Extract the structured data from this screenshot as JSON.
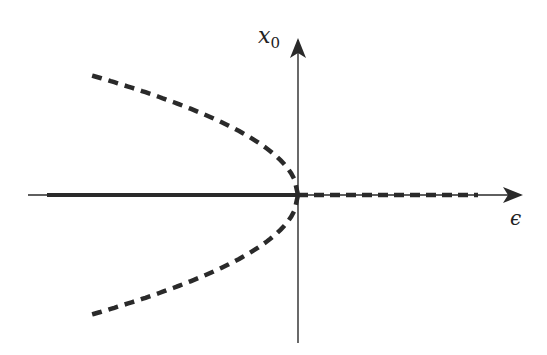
{
  "diagram": {
    "type": "bifurcation-diagram",
    "axes": {
      "x_label": "ϵ",
      "y_label": "x",
      "y_label_sub": "0"
    },
    "branches": [
      {
        "name": "trivial-stable",
        "equation": "x0 = 0, ϵ < 0",
        "style": "solid"
      },
      {
        "name": "trivial-unstable",
        "equation": "x0 = 0, ϵ > 0",
        "style": "dashed"
      },
      {
        "name": "upper-unstable",
        "equation": "x0 = +sqrt(-ϵ), ϵ < 0",
        "style": "dashed"
      },
      {
        "name": "lower-unstable",
        "equation": "x0 = -sqrt(-ϵ), ϵ < 0",
        "style": "dashed"
      }
    ],
    "colors": {
      "ink": "#2a2a2a",
      "background": "#ffffff"
    }
  }
}
